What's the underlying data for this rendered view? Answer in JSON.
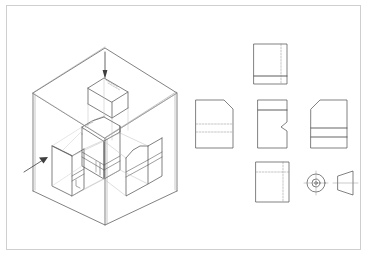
{
  "sheet": {
    "title": "Orthographic Projection Glass Box Illustration",
    "background_color": "#ffffff",
    "border_color": "#cfcfcf",
    "line_color": "#4a4a4a",
    "light_line_color": "#b9b9b9",
    "hidden_line_color": "#8a8a8a",
    "width": 368,
    "height": 257
  },
  "pictorial": {
    "name": "glass-box-isometric",
    "description": "Transparent isometric projection box containing the object with projected views on its planes",
    "arrows": [
      {
        "name": "top-projection-arrow",
        "direction": "down",
        "label": ""
      },
      {
        "name": "left-projection-arrow",
        "direction": "up-right",
        "label": ""
      }
    ],
    "planes": [
      {
        "name": "top-plane",
        "view": "top view"
      },
      {
        "name": "left-plane",
        "view": "left side view"
      },
      {
        "name": "front-plane",
        "view": "front view"
      }
    ],
    "object": {
      "name": "machined-block",
      "features": [
        "chamfered top corner",
        "horizontal groove band",
        "stepped notch"
      ]
    }
  },
  "views": [
    {
      "id": "view-top",
      "name": "top-view",
      "label": "",
      "features": [
        "rectangle",
        "horizontal band near bottom",
        "vertical hidden line right of center"
      ]
    },
    {
      "id": "view-left",
      "name": "left-side-view",
      "label": "",
      "features": [
        "chamfer top-right corner",
        "two horizontal hidden lines"
      ]
    },
    {
      "id": "view-front",
      "name": "front-view",
      "label": "",
      "features": [
        "horizontal band near top",
        "notch on right edge"
      ]
    },
    {
      "id": "view-right",
      "name": "right-side-view",
      "label": "",
      "features": [
        "chamfer top-left corner",
        "two horizontal solid lines"
      ]
    },
    {
      "id": "view-bottom",
      "name": "bottom-view",
      "label": "",
      "features": [
        "rectangle",
        "horizontal hidden centerline",
        "vertical hidden line"
      ]
    },
    {
      "id": "view-circle",
      "name": "circular-end-view",
      "label": "",
      "features": [
        "outer circle",
        "inner circle",
        "center mark"
      ]
    },
    {
      "id": "view-cone",
      "name": "conical-side-view",
      "label": "",
      "features": [
        "trapezoid",
        "horizontal centerline"
      ]
    }
  ]
}
